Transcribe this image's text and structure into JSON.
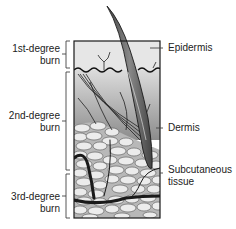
{
  "diagram": {
    "type": "skin-cross-section",
    "left_labels": [
      {
        "line1": "1st-degree",
        "line2": "burn"
      },
      {
        "line1": "2nd-degree",
        "line2": "burn"
      },
      {
        "line1": "3rd-degree",
        "line2": "burn"
      }
    ],
    "right_labels": [
      {
        "text": "Epidermis"
      },
      {
        "text": "Dermis"
      },
      {
        "line1": "Subcutaneous",
        "line2": "tissue"
      }
    ],
    "colors": {
      "outline": "#1a1a1a",
      "epidermis_fill": "#e4e4e4",
      "dermis_fill_top": "#d6d6d6",
      "dermis_fill_bottom": "#9a9a9a",
      "fat_cell_fill": "#e8e8e8",
      "fat_bg": "#bdbdbd",
      "hair": "#555555",
      "vessel": "#222222"
    }
  }
}
